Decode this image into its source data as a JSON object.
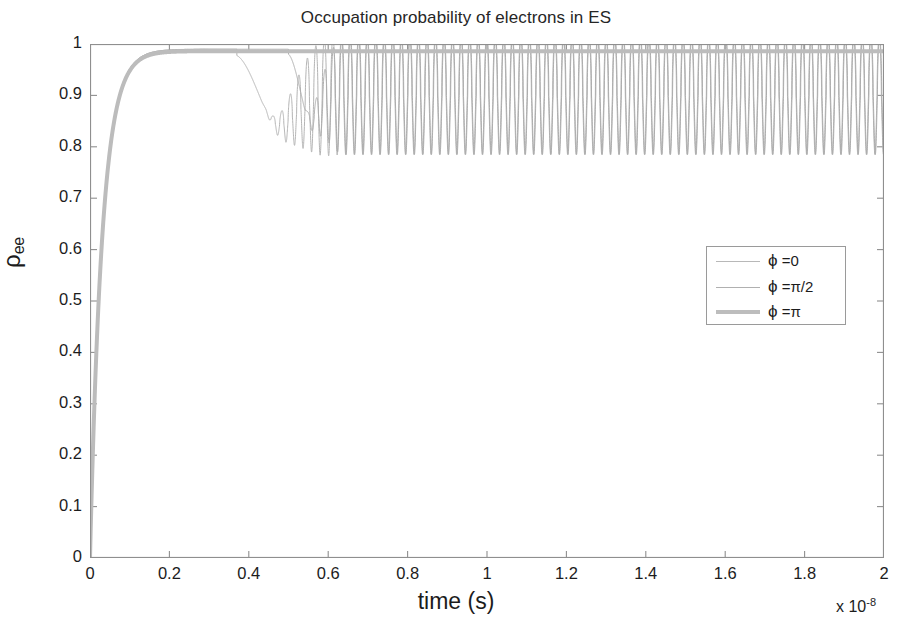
{
  "chart_data": {
    "type": "line",
    "title": "Occupation probability of electrons in ES",
    "xlabel": "time (s)",
    "ylabel": "ρee",
    "ylabel_base": "ρ",
    "ylabel_sub": "ee",
    "x_exponent_text": "x 10",
    "x_exponent_power": "-8",
    "x_scale": 1e-08,
    "xlim": [
      0,
      2
    ],
    "ylim": [
      0,
      1
    ],
    "xticks": [
      "0",
      "0.2",
      "0.4",
      "0.6",
      "0.8",
      "1",
      "1.2",
      "1.4",
      "1.6",
      "1.8",
      "2"
    ],
    "xtick_values": [
      0,
      0.2,
      0.4,
      0.6,
      0.8,
      1,
      1.2,
      1.4,
      1.6,
      1.8,
      2
    ],
    "yticks": [
      "0",
      "0.1",
      "0.2",
      "0.3",
      "0.4",
      "0.5",
      "0.6",
      "0.7",
      "0.8",
      "0.9",
      "1"
    ],
    "ytick_values": [
      0,
      0.1,
      0.2,
      0.3,
      0.4,
      0.5,
      0.6,
      0.7,
      0.8,
      0.9,
      1
    ],
    "grid": false,
    "box": true,
    "legend_position": "center-right",
    "legend": [
      {
        "label": "ϕ =0",
        "phi": "ϕ",
        "rest": " =0",
        "color": "#b8b8b8",
        "width": 1.0
      },
      {
        "label": "ϕ =π/2",
        "phi": "ϕ",
        "rest": " =π/2",
        "color": "#b0b0b0",
        "width": 1.0
      },
      {
        "label": "ϕ =π",
        "phi": "ϕ",
        "rest": " =π",
        "color": "#bdbdbd",
        "width": 4.0
      }
    ],
    "series": [
      {
        "name": "ϕ =0",
        "color": "#b4b4b4",
        "linewidth": 1.0,
        "description": "Rises from 0 to ~0.99 by t=0.12e-8, plateaus, then drops at t~0.37e-8 to a minimum ~0.775 and develops growing oscillations settling into a steady oscillation between ~0.715 and ~0.945 about a mean of ~0.90.",
        "rise_end_t": 0.12,
        "plateau_value": 0.99,
        "dip_onset_t": 0.37,
        "dip_min_value": 0.775,
        "steady_onset_t": 0.56,
        "steady_mean": 0.9,
        "steady_min": 0.715,
        "steady_max": 0.945,
        "oscillation_period_t": 0.0215
      },
      {
        "name": "ϕ =π/2",
        "color": "#adadad",
        "linewidth": 1.0,
        "description": "Identical rise and plateau at ~0.99, drops later at t~0.50e-8, falls to ~0.80 and then joins the same steady oscillation band between ~0.715 and ~0.945 around a mean of ~0.90.",
        "rise_end_t": 0.12,
        "plateau_value": 0.99,
        "dip_onset_t": 0.5,
        "dip_min_value": 0.8,
        "steady_onset_t": 0.6,
        "steady_mean": 0.9,
        "steady_min": 0.715,
        "steady_max": 0.945,
        "oscillation_period_t": 0.0215
      },
      {
        "name": "ϕ =π",
        "color": "#bcbcbc",
        "linewidth": 4.0,
        "description": "Thick gray curve. Rises from 0 to ~0.985 by t=0.12e-8 and remains flat near 0.985-0.99 for the whole window with no dip or oscillation.",
        "rise_end_t": 0.12,
        "plateau_value": 0.986,
        "dip_onset_t": null,
        "steady_mean": 0.986
      }
    ],
    "axis_color": "#8f8f8f",
    "text_color": "#1c1c1c",
    "background": "#ffffff"
  }
}
